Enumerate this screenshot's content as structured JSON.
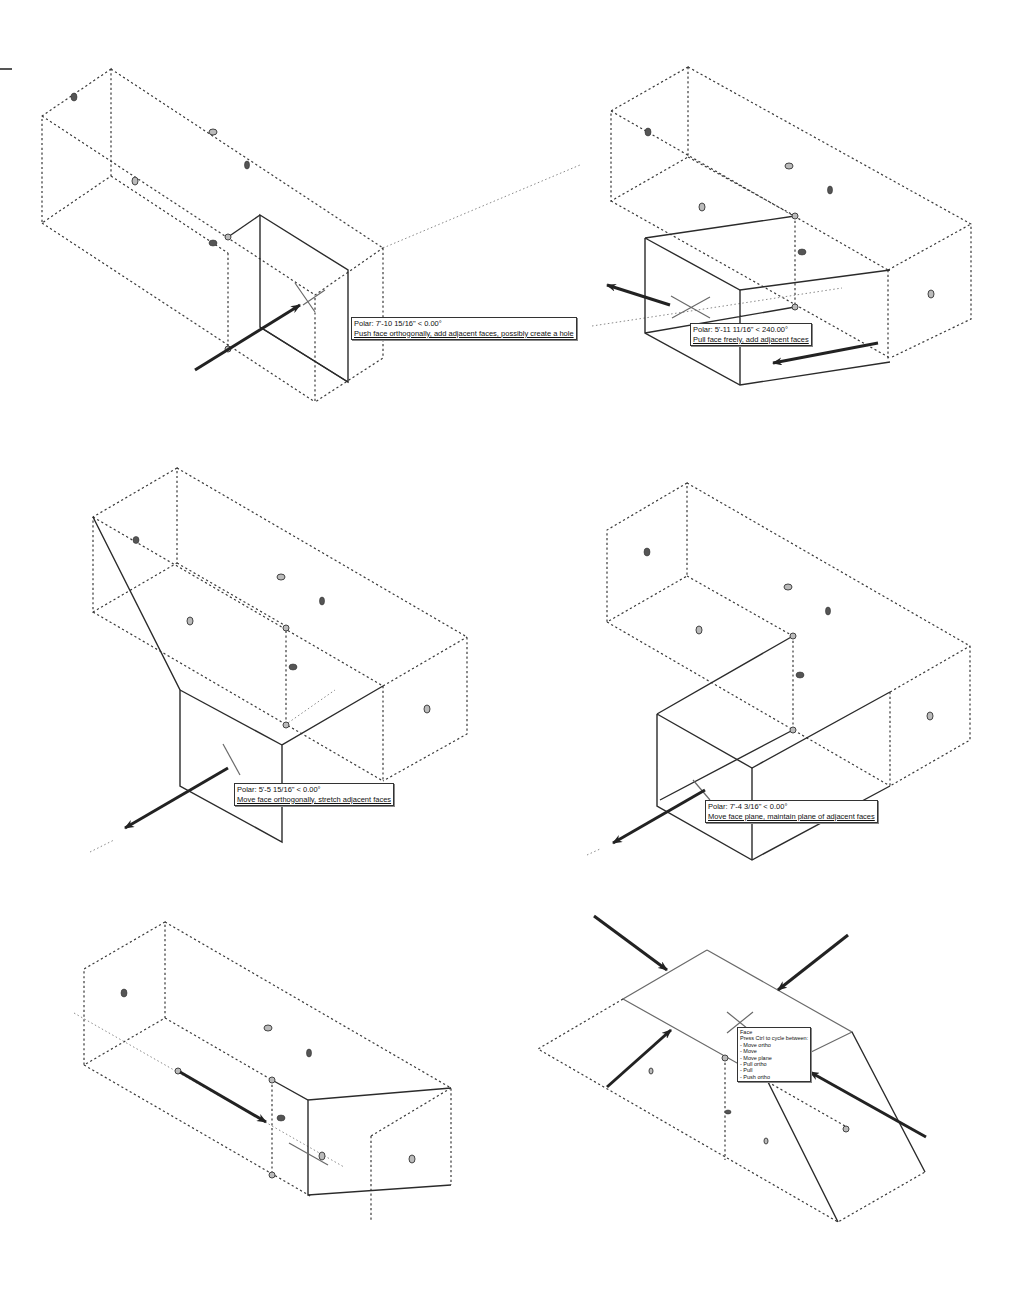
{
  "figure": {
    "panels": [
      {
        "id": "push-ortho",
        "tooltip": {
          "line1": "Polar: 7'-10 15/16\" < 0.00°",
          "line2": "Push face orthogonally, add adjacent faces, possibly create a hole"
        }
      },
      {
        "id": "pull-free",
        "tooltip": {
          "line1": "Polar: 5'-11 11/16\" < 240.00°",
          "line2": "Pull face freely, add adjacent faces"
        }
      },
      {
        "id": "move-ortho",
        "tooltip": {
          "line1": "Polar: 5'-5 15/16\" < 0.00°",
          "line2": "Move face orthogonally, stretch adjacent faces"
        }
      },
      {
        "id": "move-plane",
        "tooltip": {
          "line1": "Polar: 7'-4 3/16\" < 0.00°",
          "line2": "Move face plane, maintain plane of adjacent faces"
        }
      },
      {
        "id": "move-edge",
        "tooltip": null
      },
      {
        "id": "face-cycle",
        "tooltip": {
          "title": "Face",
          "subtitle": "Press Ctrl to cycle between:",
          "options": [
            "- Move ortho",
            "- Move",
            "- Move plane",
            "- Pull ortho",
            "- Pull",
            "- Push ortho"
          ]
        }
      }
    ],
    "colors": {
      "line": "#2b2b2b",
      "dashed": "#3a3a3a",
      "background": "#ffffff"
    }
  }
}
